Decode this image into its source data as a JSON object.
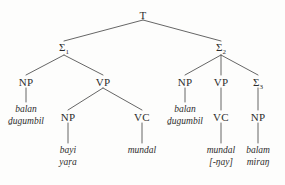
{
  "diagram": {
    "type": "syntax-tree",
    "line_color": "#555555",
    "text_color": "#2d2d2d",
    "background": "#fdfdfc",
    "nodes": {
      "root": "T",
      "sigma1": "Σ",
      "sigma1_sub": "1",
      "sigma2": "Σ",
      "sigma2_sub": "2",
      "sigma3": "Σ",
      "sigma3_sub": "3",
      "np_l1": "NP",
      "vp_l": "VP",
      "np_l2": "NP",
      "vc_l": "VC",
      "np_r1": "NP",
      "vp_r": "VP",
      "vc_r": "VC",
      "np_r2": "NP"
    },
    "terminals": {
      "np_l1_line1": "balan",
      "np_l1_line2": "ḏugumbil",
      "np_l2_line1": "bayi",
      "np_l2_line2": "yaṛa",
      "vc_l_line1": "mundal",
      "np_r1_line1": "balan",
      "np_r1_line2": "ḏugumbil",
      "vc_r_line1": "mundal",
      "vc_r_line2": "[-ŋay]",
      "np_r2_line1": "balam",
      "np_r2_line2": "miraŋ"
    }
  }
}
